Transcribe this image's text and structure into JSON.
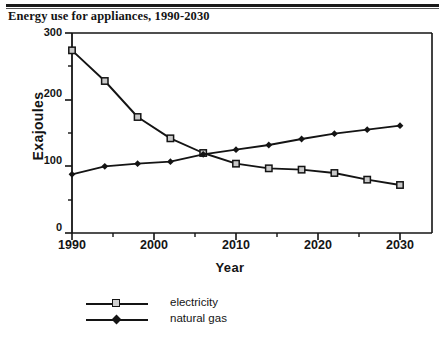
{
  "figure": {
    "title": "Energy use for appliances, 1990-2030"
  },
  "chart_data": {
    "type": "line",
    "title": "Energy use for appliances, 1990-2030",
    "xlabel": "Year",
    "ylabel": "Exajoules",
    "xlim": [
      1990,
      2030
    ],
    "ylim": [
      0,
      300
    ],
    "yticks": [
      0,
      100,
      200,
      300
    ],
    "xticks": [
      1990,
      2000,
      2010,
      2020,
      2030
    ],
    "xminorticks": [
      1995,
      2005,
      2015,
      2025
    ],
    "grid": false,
    "legend_position": "bottom-left",
    "x": [
      1990,
      1994,
      1998,
      2002,
      2006,
      2010,
      2014,
      2018,
      2022,
      2026,
      2030
    ],
    "series": [
      {
        "name": "electricity",
        "marker": "open-square",
        "values": [
          274,
          228,
          174,
          142,
          120,
          104,
          97,
          95,
          90,
          80,
          72
        ]
      },
      {
        "name": "natural gas",
        "marker": "filled-diamond",
        "values": [
          88,
          100,
          104,
          107,
          118,
          125,
          132,
          141,
          149,
          155,
          161
        ]
      }
    ],
    "colors": {
      "line": "#141414",
      "background": "#ffffff",
      "axis": "#141414"
    }
  },
  "axis": {
    "yticks": [
      "300",
      "200",
      "100",
      "0"
    ],
    "xticks": [
      "1990",
      "2000",
      "2010",
      "2020",
      "2030"
    ],
    "ylabel": "Exajoules",
    "xlabel": "Year"
  },
  "legend": {
    "items": [
      {
        "label": "electricity"
      },
      {
        "label": "natural gas"
      }
    ]
  }
}
